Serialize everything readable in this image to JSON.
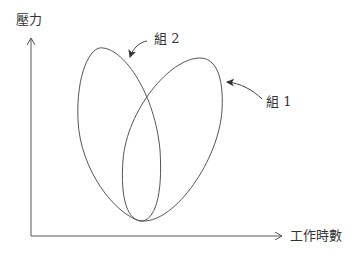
{
  "diagram": {
    "y_axis_label": "壓力",
    "x_axis_label": "工作時數",
    "groups": [
      {
        "label": "組 1",
        "shape": "ellipse",
        "position": "right, tilted toward upper-right"
      },
      {
        "label": "組 2",
        "shape": "ellipse",
        "position": "left, tilted toward upper-left"
      }
    ],
    "colors": {
      "line": "#555555",
      "text": "#333333",
      "background": "#ffffff"
    }
  }
}
